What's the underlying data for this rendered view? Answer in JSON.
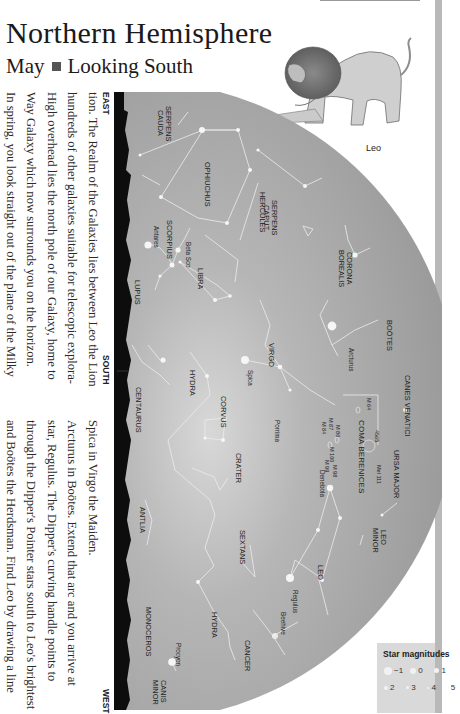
{
  "header": {
    "title": "Northern Hemisphere",
    "month": "May",
    "direction": "Looking South"
  },
  "illustration": {
    "subject": "lion",
    "label": "Leo"
  },
  "body_text": {
    "column1": [
      "In spring, you look straight out of the plane of the Milky",
      "Way Galaxy which now surrounds you on the horizon.",
      "High overhead lies the north pole of our Galaxy, home to",
      "hundreds of other galaxies suitable for telescopic explora-",
      "tion. The Realm of the Galaxies lies between Leo the Lion"
    ],
    "column2": [
      "and Boötes the Herdsman. Find Leo by drawing a line",
      "through the Dipper's Pointer stars south to Leo's brightest",
      "star, Regulus. The Dipper's curving handle points to",
      "Arcturus in Boötes. Extend that arc and you arrive at",
      "Spica in Virgo the Maiden."
    ]
  },
  "star_map": {
    "horizon_labels": {
      "east": "EAST",
      "south": "SOUTH",
      "west": "WEST"
    },
    "constellations": [
      {
        "name": "SERPENS CAUDA",
        "line1": "SERPENS",
        "line2": "CAUDA"
      },
      {
        "name": "OPHIUCHUS"
      },
      {
        "name": "HERCULES"
      },
      {
        "name": "SERPENS CAPUT",
        "line1": "SERPENS",
        "line2": "CAPUT"
      },
      {
        "name": "CORONA BOREALIS",
        "line1": "CORONA",
        "line2": "BOREALIS"
      },
      {
        "name": "SCORPIUS"
      },
      {
        "name": "LIBRA"
      },
      {
        "name": "LUPUS"
      },
      {
        "name": "BOÖTES"
      },
      {
        "name": "CANES VENATICI"
      },
      {
        "name": "VIRGO"
      },
      {
        "name": "HYDRA"
      },
      {
        "name": "CENTAURUS"
      },
      {
        "name": "CORVUS"
      },
      {
        "name": "COMA BERENICES"
      },
      {
        "name": "URSA MAJOR"
      },
      {
        "name": "CRATER"
      },
      {
        "name": "LEO MINOR",
        "line1": "LEO",
        "line2": "MINOR"
      },
      {
        "name": "ANTLIA"
      },
      {
        "name": "SEXTANS"
      },
      {
        "name": "LEO"
      },
      {
        "name": "HYDRA"
      },
      {
        "name": "MONOCEROS"
      },
      {
        "name": "CANCER"
      },
      {
        "name": "CANIS MINOR",
        "line1": "CANIS",
        "line2": "MINOR"
      }
    ],
    "stars": [
      "Antares",
      "Beta Sco",
      "Arcturus",
      "Spica",
      "Porrima",
      "Denebola",
      "Regulus",
      "Beehive",
      "Procyon"
    ],
    "deep_sky": [
      "M 64",
      "4565",
      "Mel 111",
      "M 86",
      "M 100",
      "M 87",
      "M 84",
      "M 99",
      "M 98"
    ]
  },
  "legend": {
    "title": "Star magnitudes",
    "magnitudes": [
      "−1",
      "0",
      "1",
      "2",
      "3",
      "4",
      "5"
    ]
  },
  "colors": {
    "sky_light": "#d6d6d6",
    "sky_mid": "#9e9e9e",
    "horizon": "#0d0d0d",
    "star": "#f4f4f4",
    "line": "#eaeaea",
    "legend_bg": "#d9d9d9"
  }
}
